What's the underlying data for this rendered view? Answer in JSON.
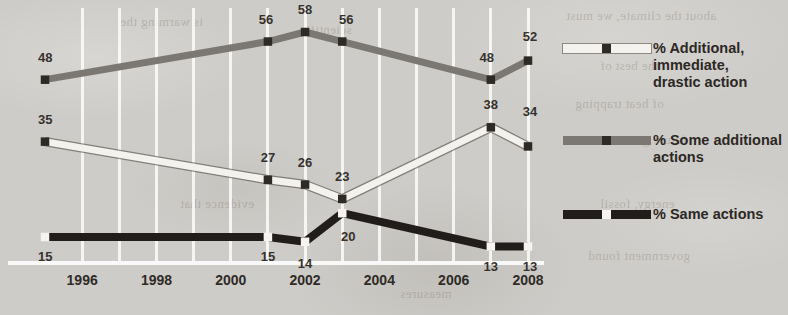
{
  "chart_data": {
    "type": "line",
    "title": "",
    "subtitle": "",
    "xlabel": "",
    "ylabel": "",
    "xlim": [
      1995,
      2008
    ],
    "ylim": [
      0,
      62
    ],
    "grid": "vertical white gridlines, one per year",
    "legend_position": "right",
    "x_tick_labels": [
      "1996",
      "1998",
      "2000",
      "2002",
      "2004",
      "2006",
      "2008"
    ],
    "x_tick_values": [
      1996,
      1998,
      2000,
      2002,
      2004,
      2006,
      2008
    ],
    "series": [
      {
        "name": "% Additional, immediate, drastic action",
        "legend_label": "% Additional,\nimmediate,\ndrastic action",
        "color": "#f4f2ee",
        "marker_color": "#2e2a26",
        "marker_style": "dark-square",
        "x": [
          1995,
          2001,
          2002,
          2003,
          2007,
          2008
        ],
        "values": [
          35,
          27,
          26,
          23,
          38,
          34
        ],
        "labels": [
          "35",
          "27",
          "26",
          "23",
          "38",
          "34"
        ]
      },
      {
        "name": "% Some additional actions",
        "legend_label": "% Some additional\nactions",
        "color": "#7b7874",
        "marker_color": "#2e2a26",
        "marker_style": "dark-square",
        "x": [
          1995,
          2001,
          2002,
          2003,
          2007,
          2008
        ],
        "values": [
          48,
          56,
          58,
          56,
          48,
          52
        ],
        "labels": [
          "48",
          "56",
          "58",
          "56",
          "48",
          "52"
        ]
      },
      {
        "name": "% Same actions",
        "legend_label": "% Same actions",
        "color": "#201d1a",
        "marker_color": "#f6f4f0",
        "marker_style": "white-square",
        "x": [
          1995,
          2001,
          2002,
          2003,
          2007,
          2008
        ],
        "values": [
          15,
          15,
          14,
          20,
          13,
          13
        ],
        "labels": [
          "15",
          "15",
          "14",
          "20",
          "13",
          "13"
        ]
      }
    ]
  },
  "legend": {
    "entries": [
      {
        "label": "% Additional,\nimmediate,\ndrastic action",
        "color": "#f4f2ee",
        "marker": "#2e2a26"
      },
      {
        "label": "% Some additional\nactions",
        "color": "#7b7874",
        "marker": "#2e2a26"
      },
      {
        "label": "% Same actions",
        "color": "#201d1a",
        "marker": "#f6f4f0"
      }
    ]
  },
  "bleed_text": [
    {
      "text": "about the climate, we must",
      "x": 566,
      "y": 8
    },
    {
      "text": "the best of",
      "x": 600,
      "y": 58
    },
    {
      "text": "of heat trapping",
      "x": 575,
      "y": 96
    },
    {
      "text": "future generations",
      "x": 585,
      "y": 132
    },
    {
      "text": "energy, fossil",
      "x": 600,
      "y": 196
    },
    {
      "text": "government found",
      "x": 588,
      "y": 248
    },
    {
      "text": "is warming the",
      "x": 120,
      "y": 14
    },
    {
      "text": "scientific",
      "x": 300,
      "y": 22
    },
    {
      "text": "evidence that",
      "x": 180,
      "y": 196
    },
    {
      "text": "measures",
      "x": 400,
      "y": 286
    }
  ]
}
